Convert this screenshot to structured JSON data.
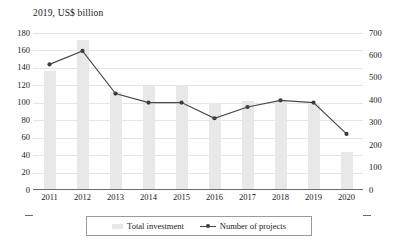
{
  "chart_data": {
    "type": "bar",
    "title": "2019, US$ billion",
    "xlabel": "",
    "ylabel": "",
    "grid": true,
    "legend_position": "bottom",
    "categories": [
      "2011",
      "2012",
      "2013",
      "2014",
      "2015",
      "2016",
      "2017",
      "2018",
      "2019",
      "2020"
    ],
    "series": [
      {
        "name": "Total investment",
        "type": "bar",
        "axis": "left",
        "unit": "US$ billion",
        "color": "#e8e8e8",
        "values": [
          136,
          172,
          112,
          119,
          120,
          100,
          102,
          102,
          100,
          44
        ]
      },
      {
        "name": "Number of projects",
        "type": "line",
        "axis": "right",
        "unit": "projects",
        "color": "#4a4a4a",
        "values": [
          560,
          620,
          430,
          390,
          390,
          320,
          370,
          400,
          390,
          250
        ]
      }
    ],
    "left_axis": {
      "min": 0,
      "max": 180,
      "step": 20,
      "ticks": [
        "0",
        "20",
        "40",
        "60",
        "80",
        "100",
        "120",
        "140",
        "160",
        "180"
      ]
    },
    "right_axis": {
      "min": 0,
      "max": 700,
      "step": 100,
      "ticks": [
        "0",
        "100",
        "200",
        "300",
        "400",
        "500",
        "600",
        "700"
      ]
    }
  },
  "legend": {
    "items": [
      {
        "label": "Total investment",
        "marker": "bar-swatch"
      },
      {
        "label": "Number of projects",
        "marker": "line-marker-swatch"
      }
    ]
  }
}
